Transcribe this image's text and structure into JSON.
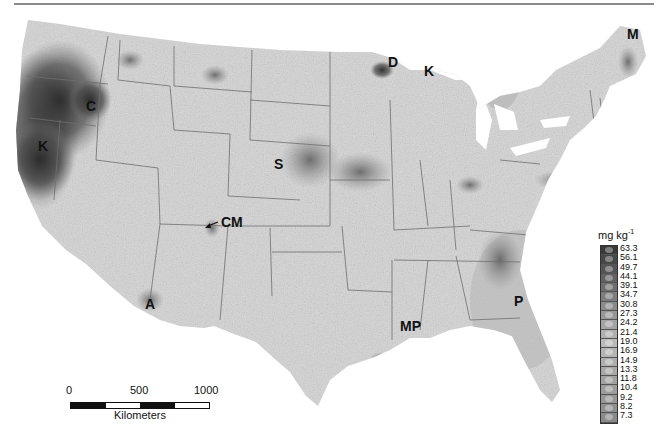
{
  "map": {
    "title": "",
    "subject": "Contiguous United States gray-scale concentration map",
    "region_labels": [
      {
        "id": "M",
        "text": "M",
        "x": 627,
        "y": 38
      },
      {
        "id": "D",
        "text": "D",
        "x": 388,
        "y": 64
      },
      {
        "id": "K-north",
        "text": "K",
        "x": 424,
        "y": 73
      },
      {
        "id": "C",
        "text": "C",
        "x": 86,
        "y": 108
      },
      {
        "id": "K-west",
        "text": "K",
        "x": 38,
        "y": 148
      },
      {
        "id": "S",
        "text": "S",
        "x": 274,
        "y": 166
      },
      {
        "id": "CM",
        "text": "CM",
        "x": 222,
        "y": 226
      },
      {
        "id": "P",
        "text": "P",
        "x": 514,
        "y": 303
      },
      {
        "id": "A",
        "text": "A",
        "x": 145,
        "y": 308
      },
      {
        "id": "MP",
        "text": "MP",
        "x": 400,
        "y": 328
      }
    ]
  },
  "legend": {
    "unit": "mg kg",
    "unit_exponent": "-1",
    "values": [
      "63.3",
      "56.1",
      "49.7",
      "44.1",
      "39.1",
      "34.7",
      "30.8",
      "27.3",
      "24.2",
      "21.4",
      "19.0",
      "16.9",
      "14.9",
      "13.3",
      "11.8",
      "10.4",
      "9.2",
      "8.2",
      "7.3"
    ],
    "colors": [
      "#3a3a3a",
      "#474747",
      "#555555",
      "#626262",
      "#6f6f6f",
      "#7d7d7d",
      "#8a8a8a",
      "#979797",
      "#a4a4a4",
      "#b0b0b0",
      "#bababa",
      "#b4b4b4",
      "#aeaeae",
      "#a8a8a8",
      "#a2a2a2",
      "#9c9c9c",
      "#969696",
      "#909090",
      "#8a8a8a"
    ]
  },
  "scale_bar": {
    "ticks": [
      "0",
      "500",
      "1000"
    ],
    "unit": "Kilometers"
  }
}
